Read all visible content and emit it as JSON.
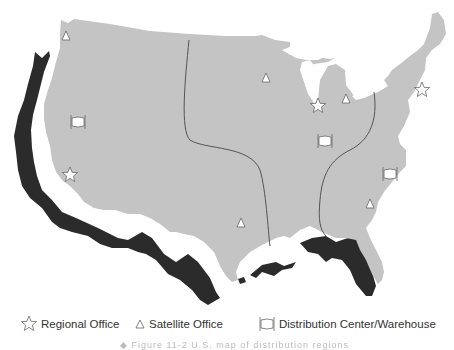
{
  "map": {
    "colors": {
      "mainland": "#c4c4c4",
      "offset_shadow": "#2b2b2b",
      "region_line": "#555555",
      "marker_fill": "#ffffff",
      "marker_stroke": "#666666",
      "background": "#ffffff"
    },
    "regions_count": 4,
    "markers": [
      {
        "type": "satellite-office",
        "x": 66,
        "y": 36
      },
      {
        "type": "distribution-center",
        "x": 78,
        "y": 122
      },
      {
        "type": "regional-office",
        "x": 70,
        "y": 175
      },
      {
        "type": "satellite-office",
        "x": 266,
        "y": 78
      },
      {
        "type": "regional-office",
        "x": 318,
        "y": 106
      },
      {
        "type": "satellite-office",
        "x": 346,
        "y": 99
      },
      {
        "type": "regional-office",
        "x": 422,
        "y": 90
      },
      {
        "type": "distribution-center",
        "x": 325,
        "y": 141
      },
      {
        "type": "distribution-center",
        "x": 390,
        "y": 174
      },
      {
        "type": "satellite-office",
        "x": 370,
        "y": 204
      },
      {
        "type": "satellite-office",
        "x": 241,
        "y": 223
      }
    ]
  },
  "legend": {
    "items": [
      {
        "icon": "star-icon",
        "label": "Regional Office"
      },
      {
        "icon": "triangle-icon",
        "label": "Satellite Office"
      },
      {
        "icon": "warehouse-icon",
        "label": "Distribution Center/Warehouse"
      }
    ]
  },
  "caption": {
    "text": "◆ Figure 11-2  U.S. map of distribution regions"
  }
}
